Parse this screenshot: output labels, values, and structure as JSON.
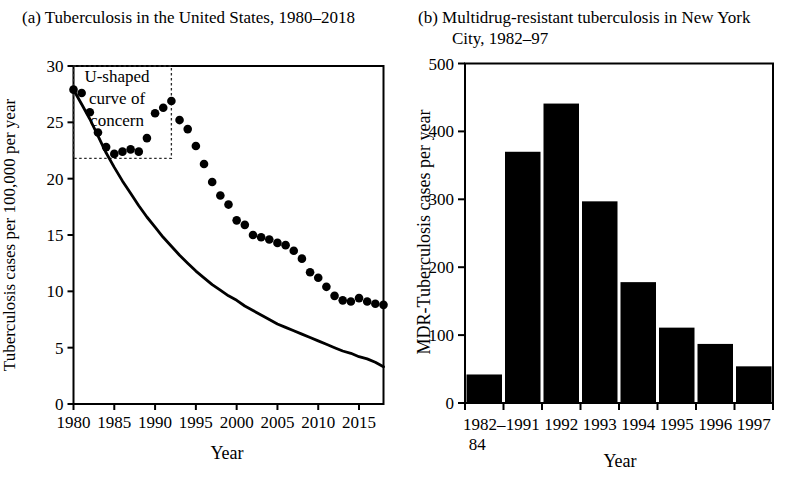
{
  "figure": {
    "background": "#ffffff",
    "ink_color": "#000000"
  },
  "chart_data": [
    {
      "id": "panel_a",
      "type": "scatter",
      "title": "(a) Tuberculosis in the United States, 1980–2018",
      "xlabel": "Year",
      "ylabel": "Tuberculosis cases per 100,000 per year",
      "xlim": [
        1980,
        2018
      ],
      "ylim": [
        0,
        30
      ],
      "x_ticks": [
        1980,
        1985,
        1990,
        1995,
        2000,
        2005,
        2010,
        2015
      ],
      "y_ticks": [
        0,
        5,
        10,
        15,
        20,
        25,
        30
      ],
      "grid": false,
      "frame": true,
      "series": [
        {
          "name": "observed-tb-rate",
          "type": "scatter",
          "marker": "filled-circle",
          "color": "#000000",
          "x": [
            1980,
            1981,
            1982,
            1983,
            1984,
            1985,
            1986,
            1987,
            1988,
            1989,
            1990,
            1991,
            1992,
            1993,
            1994,
            1995,
            1996,
            1997,
            1998,
            1999,
            2000,
            2001,
            2002,
            2003,
            2004,
            2005,
            2006,
            2007,
            2008,
            2009,
            2010,
            2011,
            2012,
            2013,
            2014,
            2015,
            2016,
            2017,
            2018
          ],
          "y": [
            27.9,
            27.6,
            25.9,
            24.1,
            22.8,
            22.2,
            22.4,
            22.6,
            22.4,
            23.6,
            25.8,
            26.3,
            26.9,
            25.2,
            24.4,
            22.9,
            21.3,
            19.7,
            18.5,
            17.7,
            16.3,
            15.9,
            15.0,
            14.8,
            14.6,
            14.3,
            14.1,
            13.6,
            12.9,
            11.7,
            11.2,
            10.4,
            9.6,
            9.2,
            9.1,
            9.4,
            9.1,
            8.9,
            8.8
          ]
        },
        {
          "name": "expected-decline-curve",
          "type": "line",
          "color": "#000000",
          "points": [
            [
              1980,
              27.9
            ],
            [
              1981,
              26.6
            ],
            [
              1982,
              25.3
            ],
            [
              1983,
              23.8
            ],
            [
              1984,
              22.3
            ],
            [
              1985,
              21.0
            ],
            [
              1986,
              19.8
            ],
            [
              1987,
              18.7
            ],
            [
              1988,
              17.6
            ],
            [
              1989,
              16.6
            ],
            [
              1990,
              15.7
            ],
            [
              1991,
              14.8
            ],
            [
              1992,
              14.0
            ],
            [
              1993,
              13.2
            ],
            [
              1994,
              12.5
            ],
            [
              1995,
              11.8
            ],
            [
              1996,
              11.2
            ],
            [
              1997,
              10.6
            ],
            [
              1998,
              10.1
            ],
            [
              1999,
              9.6
            ],
            [
              2000,
              9.2
            ],
            [
              2001,
              8.7
            ],
            [
              2002,
              8.3
            ],
            [
              2003,
              7.9
            ],
            [
              2004,
              7.5
            ],
            [
              2005,
              7.1
            ],
            [
              2006,
              6.8
            ],
            [
              2007,
              6.5
            ],
            [
              2008,
              6.2
            ],
            [
              2009,
              5.9
            ],
            [
              2010,
              5.6
            ],
            [
              2011,
              5.3
            ],
            [
              2012,
              5.0
            ],
            [
              2013,
              4.7
            ],
            [
              2014,
              4.5
            ],
            [
              2015,
              4.2
            ],
            [
              2016,
              4.0
            ],
            [
              2017,
              3.7
            ],
            [
              2018,
              3.3
            ]
          ]
        }
      ],
      "annotation": {
        "text_lines": [
          "U-shaped",
          "curve of",
          "concern"
        ],
        "text": "U-shaped curve of concern",
        "box_x": [
          1980,
          1992
        ],
        "box_y": [
          21.8,
          30
        ],
        "box_style": "dotted"
      }
    },
    {
      "id": "panel_b",
      "type": "bar",
      "title_lines": [
        "(b) Multidrug-resistant tuberculosis in New York",
        "City, 1982–97"
      ],
      "title": "(b) Multidrug-resistant tuberculosis in New York City, 1982–97",
      "xlabel": "Year",
      "ylabel": "MDR-Tuberculosis cases per year",
      "ylim": [
        0,
        500
      ],
      "y_ticks": [
        0,
        100,
        200,
        300,
        400,
        500
      ],
      "grid": false,
      "frame": true,
      "bar_color": "#000000",
      "categories": [
        "1982–84",
        "1991",
        "1992",
        "1993",
        "1994",
        "1995",
        "1996",
        "1997"
      ],
      "category_label_lines": [
        [
          "1982–",
          "84"
        ],
        [
          "1991"
        ],
        [
          "1992"
        ],
        [
          "1993"
        ],
        [
          "1994"
        ],
        [
          "1995"
        ],
        [
          "1996"
        ],
        [
          "1997"
        ]
      ],
      "values": [
        42,
        370,
        441,
        297,
        178,
        111,
        87,
        54
      ]
    }
  ]
}
